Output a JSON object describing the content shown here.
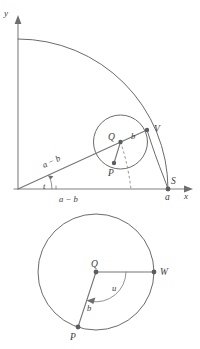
{
  "figure": {
    "colors": {
      "curve": "#6b6b6b",
      "axis": "#808080",
      "radial": "#757575",
      "dashed": "#8a8a8a",
      "point": "#5c5c5c",
      "label": "#3a3a3a",
      "background": "#ffffff"
    }
  },
  "top_panel": {
    "name": "rolling-circle-on-quarter-arc",
    "axes": {
      "y_label": "y",
      "x_label": "x",
      "origin": {
        "x": 18,
        "y": 189
      }
    },
    "big_arc": {
      "radius_label": "a",
      "center": {
        "x": 18,
        "y": 189
      },
      "radius": 150,
      "start_angle_deg": 90,
      "end_angle_deg": 0
    },
    "rolling_circle": {
      "center": {
        "x": 120.5,
        "y": 142
      },
      "radius": 27,
      "center_label": "Q",
      "radius_label": "b"
    },
    "points": [
      {
        "id": "Q",
        "label": "Q",
        "x": 120.5,
        "y": 142,
        "label_dx": -12,
        "label_dy": -3
      },
      {
        "id": "V",
        "label": "V",
        "x": 147,
        "y": 130,
        "label_dx": 7,
        "label_dy": 1
      },
      {
        "id": "P",
        "label": "P",
        "x": 114,
        "y": 163,
        "label_dx": -4,
        "label_dy": 12
      },
      {
        "id": "S",
        "label": "S",
        "x": 168,
        "y": 189,
        "label_dx": 4,
        "label_dy": -5
      }
    ],
    "labels": {
      "slant_segment": "a − b",
      "horizontal_segment": "a − b",
      "small_radius": "b",
      "angle": "t",
      "x_tick_a": "a",
      "point_S": "S",
      "point_V": "V",
      "point_Q": "Q",
      "point_P": "P"
    }
  },
  "bottom_panel": {
    "name": "rolling-circle-angle-detail",
    "circle": {
      "center": {
        "x": 96,
        "y": 272
      },
      "radius": 58,
      "center_label": "Q"
    },
    "points": [
      {
        "id": "Q",
        "label": "Q",
        "x": 96,
        "y": 272,
        "label_dx": -3,
        "label_dy": -7
      },
      {
        "id": "W",
        "label": "W",
        "x": 154,
        "y": 272,
        "label_dx": 6,
        "label_dy": 3
      },
      {
        "id": "P",
        "label": "P",
        "x": 78,
        "y": 327,
        "label_dx": -5,
        "label_dy": 11
      }
    ],
    "labels": {
      "angle": "u",
      "radius": "b",
      "point_Q": "Q",
      "point_W": "W",
      "point_P": "P"
    }
  }
}
